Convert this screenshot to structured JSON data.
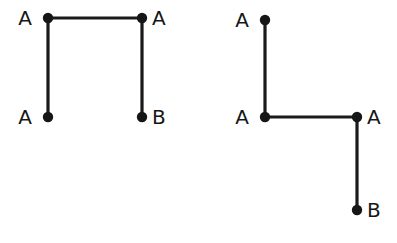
{
  "canvas": {
    "width": 397,
    "height": 243,
    "background_color": "#ffffff"
  },
  "style": {
    "stroke_color": "#1a1a1a",
    "node_color": "#161616",
    "label_color": "#161616",
    "stroke_width": 3.2,
    "node_radius": 5.2,
    "label_font_size": 20
  },
  "figures": [
    {
      "id": "left-figure",
      "name": "bracket-shape-diagram",
      "nodes": [
        {
          "id": "L1",
          "label": "A",
          "x": 48,
          "y": 18,
          "label_x": 32,
          "label_y": 25,
          "label_anchor": "end"
        },
        {
          "id": "L2",
          "label": "A",
          "x": 142,
          "y": 18,
          "label_x": 152,
          "label_y": 25,
          "label_anchor": "start"
        },
        {
          "id": "L3",
          "label": "A",
          "x": 48,
          "y": 117,
          "label_x": 32,
          "label_y": 124,
          "label_anchor": "end"
        },
        {
          "id": "L4",
          "label": "B",
          "x": 142,
          "y": 117,
          "label_x": 152,
          "label_y": 124,
          "label_anchor": "start"
        }
      ],
      "edges": [
        {
          "id": "L-top",
          "from": "L1",
          "to": "L2",
          "x1": 48,
          "y1": 18,
          "x2": 142,
          "y2": 18
        },
        {
          "id": "L-left",
          "from": "L1",
          "to": "L3",
          "x1": 48,
          "y1": 18,
          "x2": 48,
          "y2": 117
        },
        {
          "id": "L-right",
          "from": "L2",
          "to": "L4",
          "x1": 142,
          "y1": 18,
          "x2": 142,
          "y2": 117
        }
      ]
    },
    {
      "id": "right-figure",
      "name": "z-shape-diagram",
      "nodes": [
        {
          "id": "R1",
          "label": "A",
          "x": 265,
          "y": 20,
          "label_x": 249,
          "label_y": 27,
          "label_anchor": "end"
        },
        {
          "id": "R2",
          "label": "A",
          "x": 265,
          "y": 117,
          "label_x": 249,
          "label_y": 124,
          "label_anchor": "end"
        },
        {
          "id": "R3",
          "label": "A",
          "x": 357,
          "y": 117,
          "label_x": 367,
          "label_y": 124,
          "label_anchor": "start"
        },
        {
          "id": "R4",
          "label": "B",
          "x": 357,
          "y": 210,
          "label_x": 367,
          "label_y": 217,
          "label_anchor": "start"
        }
      ],
      "edges": [
        {
          "id": "R-top",
          "from": "R1",
          "to": "R2",
          "x1": 265,
          "y1": 20,
          "x2": 265,
          "y2": 117
        },
        {
          "id": "R-mid",
          "from": "R2",
          "to": "R3",
          "x1": 265,
          "y1": 117,
          "x2": 357,
          "y2": 117
        },
        {
          "id": "R-bottom",
          "from": "R3",
          "to": "R4",
          "x1": 357,
          "y1": 117,
          "x2": 357,
          "y2": 210
        }
      ]
    }
  ]
}
